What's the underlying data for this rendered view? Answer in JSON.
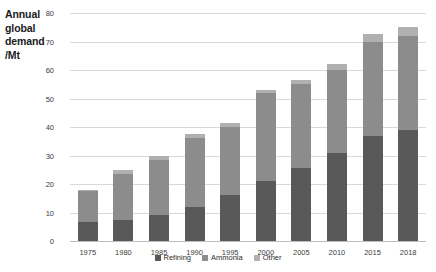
{
  "chart_data": {
    "type": "bar",
    "stacked": true,
    "title": "",
    "subtitle": "",
    "xlabel": "",
    "ylabel": "Annual global demand /Mt",
    "ylim": [
      0,
      80
    ],
    "ytick_step": 10,
    "yticks": [
      "80",
      "70",
      "60",
      "50",
      "40",
      "30",
      "20",
      "10",
      "0"
    ],
    "grid": true,
    "legend_position": "bottom",
    "categories": [
      "1975",
      "1980",
      "1985",
      "1990",
      "1995",
      "2000",
      "2005",
      "2010",
      "2015",
      "2018"
    ],
    "series": [
      {
        "name": "Refining",
        "color": "#595959",
        "values": [
          6.8,
          7.5,
          9.0,
          12.0,
          16.0,
          21.0,
          25.5,
          31.0,
          37.0,
          39.0
        ]
      },
      {
        "name": "Ammonia",
        "color": "#8c8c8c",
        "values": [
          10.7,
          16.0,
          19.5,
          24.0,
          24.0,
          31.0,
          29.5,
          29.0,
          33.0,
          33.0
        ]
      },
      {
        "name": "Other",
        "color": "#b0b0b0",
        "values": [
          0.5,
          1.5,
          1.5,
          1.5,
          1.5,
          1.0,
          1.5,
          2.0,
          2.5,
          3.0
        ]
      }
    ],
    "totals": [
      18.0,
      25.0,
      30.0,
      37.5,
      41.5,
      53.0,
      56.5,
      62.0,
      72.5,
      75.0
    ]
  },
  "axis": {
    "ylabel_text": "Annual global demand /Mt"
  },
  "colors": {
    "grid": "#d9d9d9",
    "axis": "#bfbfbf",
    "text": "#3d3d3d",
    "background": "#ffffff"
  }
}
